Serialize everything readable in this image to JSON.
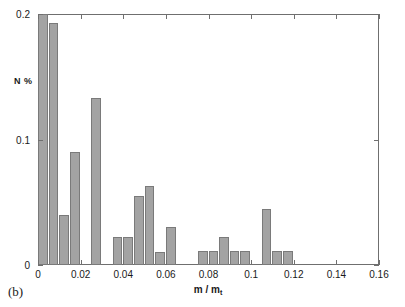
{
  "figure": {
    "panel_label": "(b)",
    "axis_color": "#6f6f6f",
    "bar_fill": "#a3a3a3",
    "bar_edge": "#7a7a7a",
    "background": "#ffffff"
  },
  "chart_data": {
    "type": "bar",
    "title": "",
    "subtitle": "",
    "xlabel": "m / m",
    "xlabel_sub": "t",
    "ylabel": "N %",
    "xlim": [
      0,
      0.16
    ],
    "ylim": [
      0,
      0.2
    ],
    "grid": false,
    "legend": null,
    "xticks": [
      0,
      0.02,
      0.04,
      0.06,
      0.08,
      0.1,
      0.12,
      0.14,
      0.16
    ],
    "xtick_labels": [
      "0",
      "0.02",
      "0.04",
      "0.06",
      "0.08",
      "0.1",
      "0.12",
      "0.14",
      "0.16"
    ],
    "yticks": [
      0,
      0.1,
      0.2
    ],
    "ytick_labels": [
      "0",
      "0.1",
      "0.2"
    ],
    "bin_width": 0.005,
    "bin_starts": [
      0,
      0.005,
      0.01,
      0.015,
      0.02,
      0.025,
      0.03,
      0.035,
      0.04,
      0.045,
      0.05,
      0.055,
      0.06,
      0.065,
      0.07,
      0.075,
      0.08,
      0.085,
      0.09,
      0.095,
      0.1,
      0.105,
      0.11,
      0.115
    ],
    "bin_centers": [
      0.0025,
      0.0075,
      0.0125,
      0.0175,
      0.0225,
      0.0275,
      0.0325,
      0.0375,
      0.0425,
      0.0475,
      0.0525,
      0.0575,
      0.0625,
      0.0675,
      0.0725,
      0.0775,
      0.0825,
      0.0875,
      0.0925,
      0.0975,
      0.1025,
      0.1075,
      0.1125,
      0.1175
    ],
    "values": [
      0.2,
      0.193,
      0.04,
      0.09,
      0.0,
      0.133,
      0.0,
      0.022,
      0.022,
      0.055,
      0.063,
      0.01,
      0.03,
      0.0,
      0.0,
      0.011,
      0.011,
      0.022,
      0.011,
      0.011,
      0.0,
      0.045,
      0.011,
      0.011
    ],
    "categories": [
      "0.0025",
      "0.0075",
      "0.0125",
      "0.0175",
      "0.0225",
      "0.0275",
      "0.0325",
      "0.0375",
      "0.0425",
      "0.0475",
      "0.0525",
      "0.0575",
      "0.0625",
      "0.0675",
      "0.0725",
      "0.0775",
      "0.0825",
      "0.0875",
      "0.0925",
      "0.0975",
      "0.1025",
      "0.1075",
      "0.1125",
      "0.1175"
    ]
  }
}
